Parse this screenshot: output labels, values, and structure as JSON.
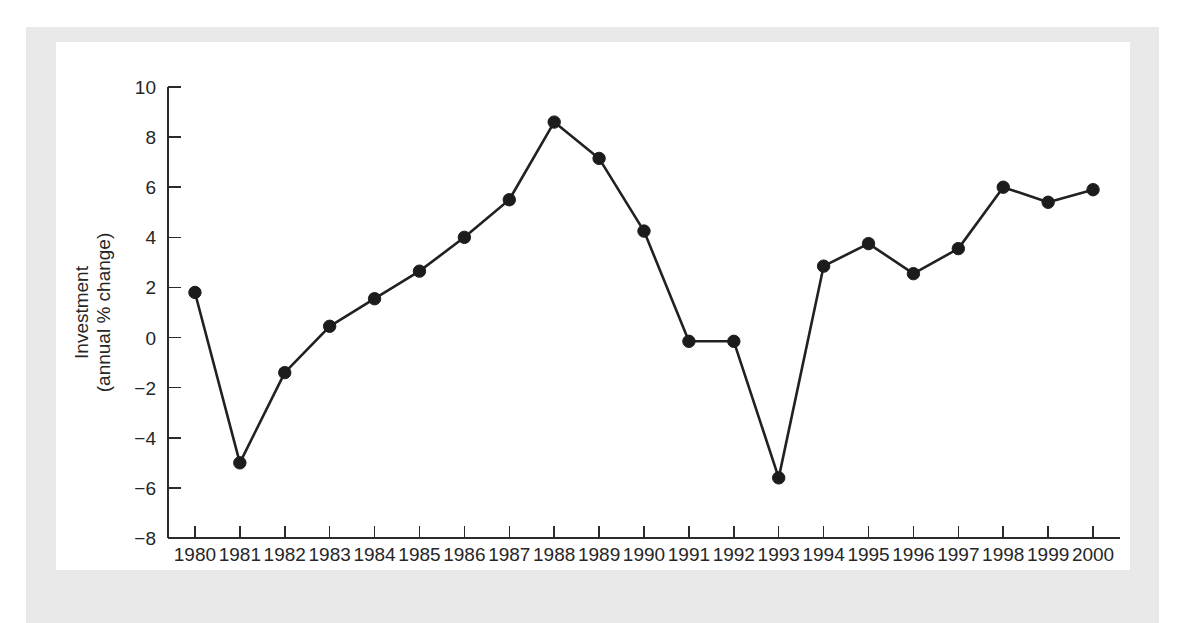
{
  "chart_data": {
    "type": "line",
    "title": "",
    "xlabel": "",
    "ylabel": "Investment\n(annual % change)",
    "ylabel_line1": "Investment",
    "ylabel_line2": "(annual % change)",
    "xlim": [
      1979.4,
      2000.6
    ],
    "ylim": [
      -8,
      10
    ],
    "yticks": [
      10,
      8,
      6,
      4,
      2,
      0,
      -2,
      -4,
      -6,
      -8
    ],
    "ytick_labels": [
      "10",
      "8",
      "6",
      "4",
      "2",
      "0",
      "−2",
      "−4",
      "−6",
      "−8"
    ],
    "grid": false,
    "legend": null,
    "marker": "filled-circle",
    "line_color": "#212121",
    "categories": [
      1980,
      1981,
      1982,
      1983,
      1984,
      1985,
      1986,
      1987,
      1988,
      1989,
      1990,
      1991,
      1992,
      1993,
      1994,
      1995,
      1996,
      1997,
      1998,
      1999,
      2000
    ],
    "xtick_labels": [
      "1980",
      "1981",
      "1982",
      "1983",
      "1984",
      "1985",
      "1986",
      "1987",
      "1988",
      "1989",
      "1990",
      "1991",
      "1992",
      "1993",
      "1994",
      "1995",
      "1996",
      "1997",
      "1998",
      "1999",
      "2000"
    ],
    "series": [
      {
        "name": "Investment (annual % change)",
        "values": [
          1.8,
          -5.0,
          -1.4,
          0.45,
          1.55,
          2.65,
          4.0,
          5.5,
          8.6,
          7.15,
          4.25,
          -0.15,
          -0.15,
          -5.6,
          2.85,
          3.75,
          2.55,
          3.55,
          6.0,
          5.4,
          5.9
        ]
      }
    ]
  },
  "figure": {
    "mat_color": "#e9e9e9",
    "plot_background": "#ffffff",
    "ink_color": "#212121"
  }
}
